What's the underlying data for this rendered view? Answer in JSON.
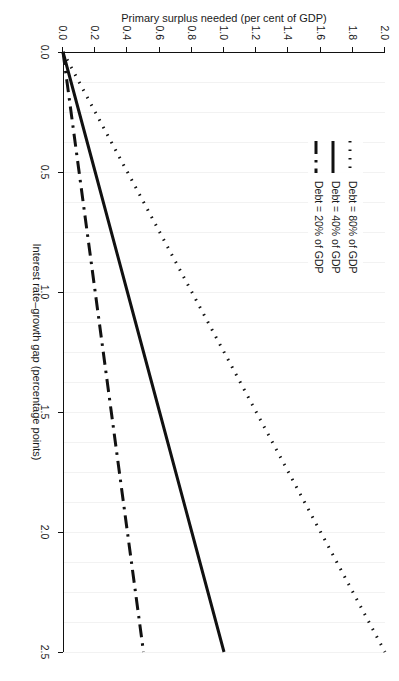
{
  "chart_data": {
    "type": "line",
    "title": "",
    "xlabel": "Interest rate–growth gap (percentage points)",
    "ylabel": "Primary surplus needed (per cent of GDP)",
    "xlim": [
      0.0,
      2.5
    ],
    "ylim": [
      0.0,
      2.0
    ],
    "xticks": [
      "0.0",
      "0.5",
      "1.0",
      "1.5",
      "2.0",
      "2.5"
    ],
    "xtick_values": [
      0.0,
      0.5,
      1.0,
      1.5,
      2.0,
      2.5
    ],
    "yticks": [
      "0.0",
      "0.2",
      "0.4",
      "0.6",
      "0.8",
      "1.0",
      "1.2",
      "1.4",
      "1.6",
      "1.8",
      "2.0"
    ],
    "ytick_values": [
      0.0,
      0.2,
      0.4,
      0.6,
      0.8,
      1.0,
      1.2,
      1.4,
      1.6,
      1.8,
      2.0
    ],
    "grid": "light vertical gridlines only",
    "legend_position": "top-left inside plot",
    "x": [
      0.0,
      0.5,
      1.0,
      1.5,
      2.0,
      2.5
    ],
    "series": [
      {
        "name": "Debt = 80% of GDP",
        "style": "dotted",
        "color": "#111111",
        "values": [
          0.0,
          0.4,
          0.8,
          1.2,
          1.6,
          2.0
        ]
      },
      {
        "name": "Debt = 40% of GDP",
        "style": "solid",
        "color": "#111111",
        "values": [
          0.0,
          0.2,
          0.4,
          0.6,
          0.8,
          1.0
        ]
      },
      {
        "name": "Debt = 20% of GDP",
        "style": "dash-dot",
        "color": "#111111",
        "values": [
          0.0,
          0.1,
          0.2,
          0.3,
          0.4,
          0.5
        ]
      }
    ]
  },
  "legend": {
    "items": [
      {
        "label": "Debt = 80% of GDP",
        "style": "dotted"
      },
      {
        "label": "Debt = 40% of GDP",
        "style": "solid"
      },
      {
        "label": "Debt = 20% of GDP",
        "style": "dash-dot"
      }
    ]
  },
  "axes": {
    "x_title": "Interest rate–growth gap (percentage points)",
    "y_title": "Primary surplus needed (per cent of GDP)"
  }
}
